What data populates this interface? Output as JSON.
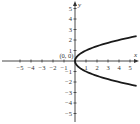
{
  "chart_data": {
    "type": "line",
    "title": "",
    "xlabel": "x",
    "ylabel": "y",
    "xlim": [
      -5.6,
      5.6
    ],
    "ylim": [
      -5.6,
      5.6
    ],
    "grid": false,
    "legend": null,
    "x_ticks": [
      -5,
      -4,
      -3,
      -2,
      -1,
      1,
      2,
      3,
      4,
      5
    ],
    "y_ticks": [
      5,
      4,
      3,
      2,
      1,
      -1,
      -2,
      -3,
      -4,
      -5
    ],
    "x_tick_labels": [
      "−5",
      "−4",
      "−3",
      "−2",
      "−1",
      "1",
      "2",
      "3",
      "4",
      "5"
    ],
    "y_tick_labels": [
      "5",
      "4",
      "3",
      "2",
      "1",
      "−1",
      "−2",
      "−3",
      "−4",
      "−5"
    ],
    "annotations": [
      {
        "text": "(0, 0)",
        "x": 0,
        "y": 0
      }
    ],
    "series": [
      {
        "name": "x = y^2",
        "equation": "x = y^2",
        "color": "#1a1a1a",
        "points": [
          [
            5.6,
            2.37
          ],
          [
            5,
            2.24
          ],
          [
            4,
            2
          ],
          [
            3,
            1.73
          ],
          [
            2,
            1.41
          ],
          [
            1,
            1
          ],
          [
            0.5,
            0.71
          ],
          [
            0.25,
            0.5
          ],
          [
            0,
            0
          ],
          [
            0.25,
            -0.5
          ],
          [
            0.5,
            -0.71
          ],
          [
            1,
            -1
          ],
          [
            2,
            -1.41
          ],
          [
            3,
            -1.73
          ],
          [
            4,
            -2
          ],
          [
            5,
            -2.24
          ],
          [
            5.6,
            -2.37
          ]
        ]
      }
    ],
    "vertex": [
      0,
      0
    ]
  },
  "axes": {
    "x_label": "x",
    "y_label": "y",
    "origin_label": "(0, 0)",
    "axis_color": "#333333",
    "curve_color": "#1a1a1a"
  }
}
